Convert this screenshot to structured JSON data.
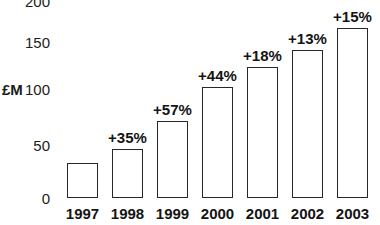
{
  "chart_data": {
    "type": "bar",
    "title": "",
    "xlabel": "",
    "ylabel": "£M",
    "categories": [
      "1997",
      "1998",
      "1999",
      "2000",
      "2001",
      "2002",
      "2003"
    ],
    "values": [
      33,
      46,
      72,
      104,
      123,
      139,
      160
    ],
    "annotations": [
      "",
      "+35%",
      "+57%",
      "+44%",
      "+18%",
      "+13%",
      "+15%"
    ],
    "ylim": [
      0,
      200
    ],
    "yticks": [
      0,
      50,
      100,
      150,
      200
    ],
    "ytick_labels": [
      "0",
      "50",
      "100",
      "150",
      "200"
    ],
    "grid": false,
    "legend": null,
    "bar_fill_color": "#ffffff",
    "bar_edge_color": "#272727",
    "background_color": "#ffffff",
    "text_color": "#141414",
    "note": "Top tick label 200 is clipped by the top edge of the image"
  }
}
